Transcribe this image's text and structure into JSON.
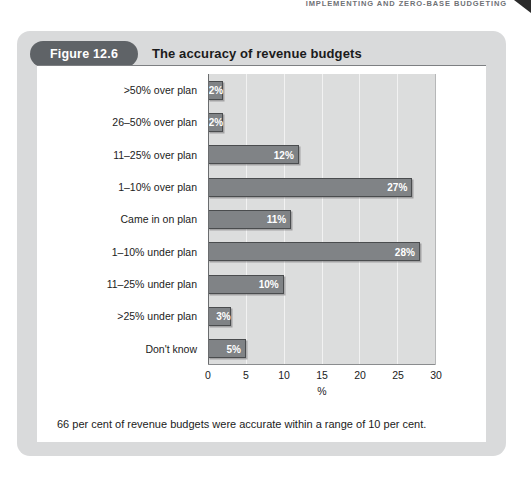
{
  "running_head": "IMPLEMENTING AND ZERO-BASE BUDGETING",
  "figure": {
    "badge": "Figure 12.6",
    "title": "The accuracy of revenue budgets",
    "caption": "66 per cent of revenue budgets were accurate within a range of 10 per cent."
  },
  "colors": {
    "card_background": "#d9dadb",
    "badge_background": "#5f6367",
    "plot_background": "#dcdddd",
    "bar_fill": "#808386",
    "bar_border": "#4a4c4e",
    "bar_label": "#ffffff",
    "gridline": "#f2f2f2"
  },
  "chart_data": {
    "type": "bar",
    "orientation": "horizontal",
    "title": "The accuracy of revenue budgets",
    "xlabel": "%",
    "ylabel": "",
    "xlim": [
      0,
      30
    ],
    "xticks": [
      0,
      5,
      10,
      15,
      20,
      25,
      30
    ],
    "grid": true,
    "legend": false,
    "categories": [
      ">50% over plan",
      "26–50% over plan",
      "11–25% over plan",
      "1–10% over plan",
      "Came in on plan",
      "1–10% under plan",
      "11–25% under plan",
      ">25% under plan",
      "Don't know"
    ],
    "values": [
      2,
      2,
      12,
      27,
      11,
      28,
      10,
      3,
      5
    ],
    "value_labels": [
      "2%",
      "2%",
      "12%",
      "27%",
      "11%",
      "28%",
      "10%",
      "3%",
      "5%"
    ],
    "annotation": "66 per cent of revenue budgets were accurate within a range of 10 per cent."
  }
}
